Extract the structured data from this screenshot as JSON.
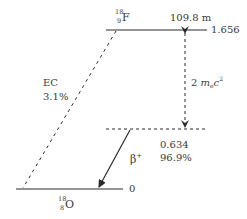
{
  "diagram": {
    "type": "nuclear-decay-scheme",
    "parent": {
      "mass_number": "18",
      "atomic_number": "9",
      "symbol": "F",
      "half_life": "109.8 m",
      "energy_level": "1.656"
    },
    "daughter": {
      "mass_number": "18",
      "atomic_number": "8",
      "symbol": "O",
      "energy_level": "0"
    },
    "branches": {
      "ec": {
        "label": "EC",
        "fraction": "3.1%"
      },
      "beta_plus": {
        "label": "β",
        "charge": "+",
        "endpoint_energy": "0.634",
        "fraction": "96.9%"
      }
    },
    "pair_energy_gap": {
      "prefix": "2 ",
      "mass_symbol": "m",
      "mass_subscript": "e",
      "light_symbol": "c",
      "exponent": "2"
    },
    "colors": {
      "line": "#2a2a2a",
      "text": "#3a3a3a",
      "background": "#ffffff"
    }
  }
}
